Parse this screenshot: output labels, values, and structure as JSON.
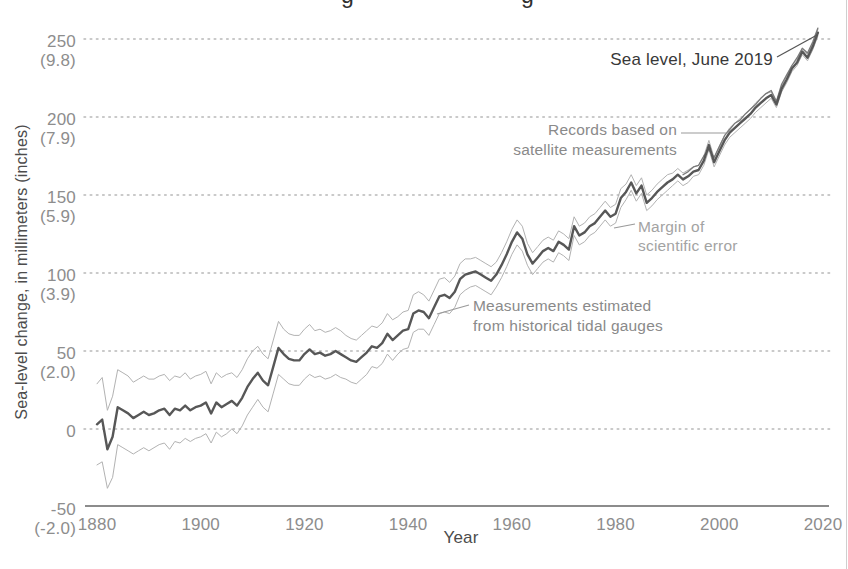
{
  "figure_note": "line chart of global sea-level change 1880-2019; page title cropped at top edge (only two letter descenders visible)",
  "title_fragment": {
    "glyphs": [
      "g",
      "g"
    ]
  },
  "y_axis": {
    "label": "Sea-level change, in millimeters (inches)",
    "ticks": [
      {
        "mm": "250",
        "inches": "(9.8)"
      },
      {
        "mm": "200",
        "inches": "(7.9)"
      },
      {
        "mm": "150",
        "inches": "(5.9)"
      },
      {
        "mm": "100",
        "inches": "(3.9)"
      },
      {
        "mm": "50",
        "inches": "(2.0)"
      },
      {
        "mm": "0",
        "inches": ""
      },
      {
        "mm": "-50",
        "inches": "(-2.0)"
      }
    ]
  },
  "x_axis": {
    "label": "Year",
    "ticks": [
      "1880",
      "1900",
      "1920",
      "1940",
      "1960",
      "1980",
      "2000",
      "2020"
    ]
  },
  "annotations": {
    "sea_level_point": "Sea level, June 2019",
    "satellite_line1": "Records based on",
    "satellite_line2": "satellite measurements",
    "margin_line1": "Margin of",
    "margin_line2": "scientific error",
    "tidal_line1": "Measurements estimated",
    "tidal_line2": "from historical tidal gauges"
  },
  "colors": {
    "main_line": "#575757",
    "satellite_line": "#7a7a7a",
    "error_line": "#b2b2b2",
    "gridline": "#b8b8b8",
    "axis_line": "#666666",
    "leader_dark": "#555555",
    "leader_gray": "#9a9a9a",
    "tick_text": "#8d8d8d",
    "page_edge": "#cfcfcf"
  },
  "chart_data": {
    "type": "line",
    "title": "",
    "xlabel": "Year",
    "ylabel": "Sea-level change, in millimeters (inches)",
    "x_range": [
      1880,
      2020
    ],
    "ylim_mm": [
      -50,
      250
    ],
    "grid": "horizontal dotted lines at 0,50,100,150,200,250 mm",
    "legend_position": "inline annotations with leader lines",
    "years_start": 1880,
    "years_step": 1,
    "years_end": 2019,
    "gridline_values_mm": [
      250,
      200,
      150,
      100,
      50,
      0
    ],
    "series": [
      {
        "name": "sea-level-change-mm (tidal gauge estimate, thick gray line)",
        "values": [
          3,
          6,
          -13,
          -5,
          14,
          12,
          10,
          7,
          9,
          11,
          9,
          10,
          12,
          13,
          9,
          13,
          12,
          15,
          12,
          14,
          15,
          17,
          10,
          17,
          14,
          16,
          18,
          15,
          20,
          27,
          32,
          36,
          31,
          28,
          40,
          52,
          48,
          45,
          44,
          44,
          48,
          51,
          48,
          49,
          47,
          48,
          50,
          48,
          46,
          44,
          43,
          46,
          49,
          53,
          52,
          55,
          61,
          57,
          60,
          63,
          64,
          74,
          76,
          75,
          71,
          78,
          85,
          86,
          84,
          88,
          96,
          99,
          100,
          101,
          99,
          97,
          95,
          99,
          105,
          112,
          120,
          126,
          122,
          112,
          106,
          110,
          114,
          116,
          114,
          120,
          118,
          115,
          130,
          124,
          126,
          130,
          132,
          136,
          140,
          136,
          138,
          148,
          152,
          158,
          151,
          156,
          145,
          148,
          152,
          155,
          158,
          160,
          163,
          160,
          162,
          165,
          166,
          172,
          182,
          171,
          178,
          185,
          190,
          193,
          196,
          199,
          202,
          206,
          209,
          212,
          214,
          208,
          218,
          224,
          231,
          235,
          242,
          238,
          245,
          254
        ]
      },
      {
        "name": "margin-of-scientific-error-halfwidth-mm (thin light lines at value±margin)",
        "values": [
          26,
          27,
          25,
          26,
          24,
          24,
          24,
          23,
          23,
          23,
          23,
          22,
          22,
          22,
          22,
          21,
          21,
          21,
          20,
          20,
          20,
          20,
          19,
          19,
          19,
          19,
          18,
          18,
          18,
          18,
          18,
          17,
          17,
          17,
          17,
          17,
          16,
          16,
          16,
          16,
          16,
          16,
          15,
          15,
          15,
          15,
          15,
          15,
          14,
          14,
          14,
          14,
          14,
          13,
          13,
          13,
          13,
          13,
          12,
          12,
          12,
          12,
          12,
          11,
          11,
          11,
          11,
          11,
          10,
          10,
          10,
          10,
          9,
          9,
          9,
          9,
          9,
          8,
          8,
          8,
          8,
          8,
          8,
          7,
          7,
          7,
          7,
          7,
          7,
          7,
          7,
          7,
          6,
          6,
          6,
          6,
          6,
          6,
          6,
          6,
          6,
          6,
          5,
          5,
          5,
          5,
          5,
          5,
          5,
          5,
          5,
          4,
          4,
          4,
          4,
          3,
          3,
          3,
          3,
          3,
          3,
          3,
          3,
          3,
          3,
          3,
          3,
          3,
          3,
          3,
          2,
          2,
          2,
          2,
          2,
          2,
          2,
          2,
          2,
          2
        ]
      },
      {
        "name": "satellite-measurements-mm (thin darker line, 1993-2019)",
        "x_start": 1993,
        "values": [
          163,
          165,
          168,
          169,
          175,
          179,
          174,
          181,
          188,
          192,
          196,
          198,
          202,
          205,
          208,
          212,
          215,
          217,
          210,
          221,
          227,
          233,
          238,
          244,
          241,
          248,
          257
        ]
      }
    ],
    "end_point": {
      "label": "Sea level, June 2019",
      "year": 2019.5,
      "value_mm": 255
    }
  }
}
